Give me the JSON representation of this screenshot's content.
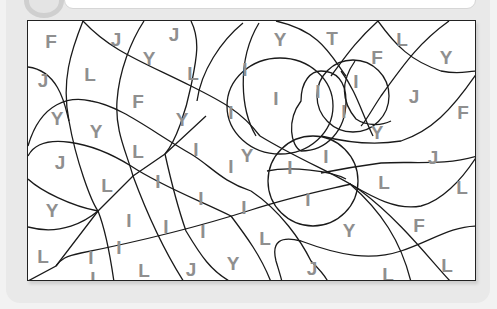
{
  "worksheet": {
    "type": "color-by-letter puzzle",
    "letter_color": "#8f8f8f",
    "line_color": "#1a1a1a",
    "background_color": "#e9e9e9"
  },
  "letters": [
    {
      "char": "F",
      "x": 50,
      "y": 40
    },
    {
      "char": "J",
      "x": 115,
      "y": 38
    },
    {
      "char": "J",
      "x": 173,
      "y": 33
    },
    {
      "char": "Y",
      "x": 148,
      "y": 57
    },
    {
      "char": "L",
      "x": 89,
      "y": 73
    },
    {
      "char": "L",
      "x": 192,
      "y": 72
    },
    {
      "char": "J",
      "x": 42,
      "y": 79
    },
    {
      "char": "I",
      "x": 244,
      "y": 68
    },
    {
      "char": "Y",
      "x": 279,
      "y": 38
    },
    {
      "char": "T",
      "x": 331,
      "y": 37
    },
    {
      "char": "L",
      "x": 401,
      "y": 38
    },
    {
      "char": "F",
      "x": 376,
      "y": 56
    },
    {
      "char": "Y",
      "x": 445,
      "y": 56
    },
    {
      "char": "I",
      "x": 275,
      "y": 97
    },
    {
      "char": "I",
      "x": 317,
      "y": 90
    },
    {
      "char": "I",
      "x": 355,
      "y": 80
    },
    {
      "char": "I",
      "x": 343,
      "y": 110
    },
    {
      "char": "J",
      "x": 413,
      "y": 95
    },
    {
      "char": "F",
      "x": 462,
      "y": 111
    },
    {
      "char": "Y",
      "x": 56,
      "y": 117
    },
    {
      "char": "Y",
      "x": 95,
      "y": 130
    },
    {
      "char": "F",
      "x": 137,
      "y": 100
    },
    {
      "char": "Y",
      "x": 181,
      "y": 118
    },
    {
      "char": "I",
      "x": 230,
      "y": 111
    },
    {
      "char": "Y",
      "x": 376,
      "y": 131
    },
    {
      "char": "I",
      "x": 195,
      "y": 148
    },
    {
      "char": "L",
      "x": 137,
      "y": 150
    },
    {
      "char": "Y",
      "x": 246,
      "y": 154
    },
    {
      "char": "I",
      "x": 230,
      "y": 165
    },
    {
      "char": "I",
      "x": 289,
      "y": 166
    },
    {
      "char": "I",
      "x": 325,
      "y": 155
    },
    {
      "char": "J",
      "x": 432,
      "y": 156
    },
    {
      "char": "J",
      "x": 59,
      "y": 161
    },
    {
      "char": "L",
      "x": 106,
      "y": 184
    },
    {
      "char": "I",
      "x": 157,
      "y": 180
    },
    {
      "char": "I",
      "x": 200,
      "y": 197
    },
    {
      "char": "I",
      "x": 243,
      "y": 206
    },
    {
      "char": "I",
      "x": 307,
      "y": 198
    },
    {
      "char": "L",
      "x": 383,
      "y": 181
    },
    {
      "char": "L",
      "x": 461,
      "y": 186
    },
    {
      "char": "Y",
      "x": 51,
      "y": 209
    },
    {
      "char": "I",
      "x": 128,
      "y": 219
    },
    {
      "char": "I",
      "x": 165,
      "y": 225
    },
    {
      "char": "I",
      "x": 202,
      "y": 230
    },
    {
      "char": "L",
      "x": 264,
      "y": 237
    },
    {
      "char": "Y",
      "x": 348,
      "y": 229
    },
    {
      "char": "F",
      "x": 418,
      "y": 224
    },
    {
      "char": "L",
      "x": 42,
      "y": 255
    },
    {
      "char": "I",
      "x": 90,
      "y": 256
    },
    {
      "char": "I",
      "x": 118,
      "y": 246
    },
    {
      "char": "L",
      "x": 95,
      "y": 277
    },
    {
      "char": "L",
      "x": 143,
      "y": 269
    },
    {
      "char": "J",
      "x": 190,
      "y": 268
    },
    {
      "char": "Y",
      "x": 232,
      "y": 262
    },
    {
      "char": "J",
      "x": 311,
      "y": 267
    },
    {
      "char": "L",
      "x": 387,
      "y": 273
    },
    {
      "char": "L",
      "x": 446,
      "y": 264
    }
  ]
}
